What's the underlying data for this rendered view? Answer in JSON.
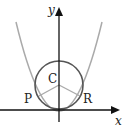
{
  "diagram": {
    "axes": {
      "x_label": "x",
      "y_label": "y"
    },
    "points": {
      "center": "C",
      "left_tangent": "P",
      "right_tangent": "R"
    },
    "colors": {
      "axes": "#111111",
      "circle": "#555555",
      "parabola": "#aaaaaa",
      "radii": "#aaaaaa",
      "text": "#222222"
    },
    "shapes": [
      "parabola opening upward with vertex at origin",
      "circle centered at C on y-axis tangent to parabola at P and R",
      "segments CP and CR"
    ]
  }
}
